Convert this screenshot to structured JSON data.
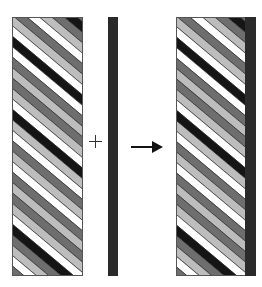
{
  "diagram": {
    "operators": {
      "plus": "+",
      "arrow": "→"
    },
    "colors": {
      "white": "#ffffff",
      "light": "#bdbdbd",
      "mid": "#6e6e6e",
      "black": "#151515",
      "bar": "#2a2a2a",
      "border": "#555555"
    },
    "stripe_angle_deg": 40,
    "stripe_width": 8,
    "stripe_sequence": [
      "white",
      "light",
      "mid",
      "black",
      "mid",
      "light",
      "white",
      "mid",
      "light",
      "white",
      "black",
      "white",
      "mid",
      "light",
      "mid",
      "light",
      "white",
      "black",
      "light",
      "white",
      "mid",
      "light",
      "white",
      "mid",
      "light",
      "mid",
      "light",
      "white",
      "black",
      "mid",
      "light",
      "white",
      "mid",
      "light",
      "white",
      "mid",
      "black",
      "white",
      "light",
      "mid",
      "light",
      "white",
      "mid",
      "light",
      "white",
      "black",
      "mid",
      "light",
      "white",
      "mid"
    ],
    "panels": [
      {
        "name": "source-striped-rectangle"
      },
      {
        "name": "vertical-bar"
      },
      {
        "name": "result-striped-rectangle-with-bar"
      }
    ]
  }
}
